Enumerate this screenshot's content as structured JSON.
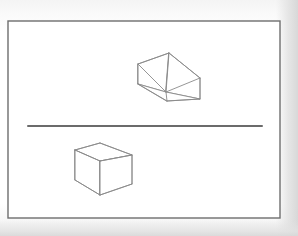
{
  "figure": {
    "title": "Two-box perspective study with horizon line",
    "medium": "line drawing on white paper",
    "page": {
      "width": 298,
      "height": 236,
      "background_color": "#ffffff",
      "paper_tint_color": "#fafafa",
      "shadow_color": "#dcdcdc"
    },
    "frame": {
      "name": "drawing-border",
      "x": 8,
      "y": 21,
      "width": 272,
      "height": 197,
      "stroke_color": "#6e6e6e",
      "stroke_width": 1.4,
      "fill_color": "#ffffff"
    },
    "horizon_line": {
      "name": "horizon-line",
      "x1": 28,
      "y1": 126,
      "x2": 262,
      "y2": 126,
      "stroke_color": "#3a3a3a",
      "stroke_width": 1.5,
      "description": "eye level horizon"
    },
    "shapes": [
      {
        "id": "upper-box",
        "label": "Box above horizon (seen from below)",
        "stroke_color": "#8a8a8a",
        "stroke_width": 0.9,
        "fill_color": "#ffffff",
        "position": "above horizon line",
        "viewpoint": "underside visible",
        "vertices": {
          "top_apex": [
            169,
            53
          ],
          "left_top": [
            138,
            64
          ],
          "right_top": [
            200,
            78
          ],
          "center_near": [
            166,
            92
          ],
          "left_bottom": [
            138,
            84
          ],
          "right_bottom": [
            200,
            99
          ],
          "bottom_near": [
            167,
            101
          ]
        },
        "edges": [
          "top_apex-left_top",
          "top_apex-right_top",
          "top_apex-center_near",
          "left_top-left_bottom",
          "right_top-right_bottom",
          "left_top-center_near",
          "right_top-center_near",
          "center_near-bottom_near",
          "left_bottom-bottom_near",
          "right_bottom-bottom_near"
        ]
      },
      {
        "id": "lower-box",
        "label": "Box below horizon (seen from above)",
        "stroke_color": "#8a8a8a",
        "stroke_width": 0.9,
        "fill_color": "#ffffff",
        "position": "below horizon line",
        "viewpoint": "top face visible",
        "vertices": {
          "top_left": [
            75,
            150
          ],
          "top_apex": [
            100,
            143
          ],
          "top_right": [
            132,
            155
          ],
          "center_near": [
            100,
            161
          ],
          "left_bottom": [
            75,
            180
          ],
          "right_bottom": [
            132,
            184
          ],
          "bottom_near": [
            100,
            195
          ]
        },
        "edges": [
          "top_left-top_apex",
          "top_apex-top_right",
          "top_left-center_near",
          "top_right-center_near",
          "top_left-left_bottom",
          "top_right-right_bottom",
          "center_near-bottom_near",
          "left_bottom-bottom_near",
          "right_bottom-bottom_near"
        ]
      }
    ]
  }
}
